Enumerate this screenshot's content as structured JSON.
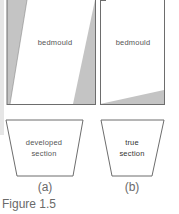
{
  "figure": {
    "caption": "Figure 1.5",
    "colors": {
      "line": "#6d6d6d",
      "shade": "#c4c4c4",
      "fill": "#ffffff"
    },
    "panels": [
      {
        "id": "a",
        "sub_label": "(a)",
        "plan_label": "bedmould",
        "section_label_line1": "developed",
        "section_label_line2": "section"
      },
      {
        "id": "b",
        "sub_label": "(b)",
        "plan_label": "bedmould",
        "section_label_line1": "true",
        "section_label_line2": "section"
      }
    ]
  }
}
